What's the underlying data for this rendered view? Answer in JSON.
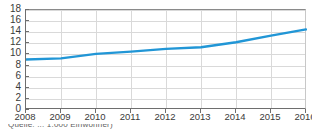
{
  "chart_data": {
    "type": "line",
    "title": "",
    "subtitle": "",
    "xlabel": "",
    "ylabel": "",
    "x": [
      2008,
      2009,
      2010,
      2011,
      2012,
      2013,
      2014,
      2015,
      2016
    ],
    "categories": [
      "2008",
      "2009",
      "2010",
      "2011",
      "2012",
      "2013",
      "2014",
      "2015",
      "2016"
    ],
    "series": [
      {
        "name": "series-1",
        "color": "#2196d6",
        "values": [
          9.1,
          9.3,
          10.1,
          10.5,
          11.0,
          11.3,
          12.2,
          13.4,
          14.5
        ]
      }
    ],
    "values": [
      9.1,
      9.3,
      10.1,
      10.5,
      11.0,
      11.3,
      12.2,
      13.4,
      14.5
    ],
    "ylim": [
      0,
      18
    ],
    "yticks": [
      0,
      2,
      4,
      6,
      8,
      10,
      12,
      14,
      16,
      18
    ],
    "ytick_labels": [
      "0",
      "2",
      "4",
      "6",
      "8",
      "10",
      "12",
      "14",
      "16",
      "18"
    ],
    "xlim": [
      2008,
      2016
    ],
    "xticks": [
      2008,
      2009,
      2010,
      2011,
      2012,
      2013,
      2014,
      2015,
      2016
    ],
    "xtick_labels": [
      "2008",
      "2009",
      "2010",
      "2011",
      "2012",
      "2013",
      "2014",
      "2015",
      "2016"
    ],
    "grid": true,
    "grid_color": "#d9d9d9",
    "legend": false,
    "legend_position": "none",
    "axis_color": "#6e6e6e",
    "background": "#ffffff",
    "line_width": 2.4
  },
  "caption": {
    "clipped_text": "Quelle: ... 1.000 Einwohner)"
  }
}
